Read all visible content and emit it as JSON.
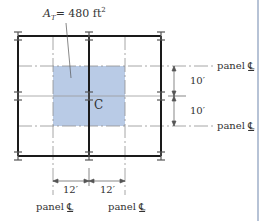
{
  "figure": {
    "tributary_area_label": {
      "symbol": "A",
      "subscript": "T",
      "equals": "= 480 ft",
      "superscript": "2"
    },
    "column_label": "C",
    "dimensions": {
      "vertical": [
        "10′",
        "10′"
      ],
      "horizontal": [
        "12′",
        "12′"
      ]
    },
    "panel_centerlines": {
      "right": [
        {
          "text": "panel",
          "symbol": "℄"
        },
        {
          "text": "panel",
          "symbol": "℄"
        }
      ],
      "bottom": [
        {
          "text": "panel",
          "symbol": "℄"
        },
        {
          "text": "panel",
          "symbol": "℄"
        }
      ]
    },
    "colors": {
      "shaded_area": "#b9cbe6",
      "beam": "#1a1a1a",
      "centerline": "#8a8a8a",
      "column": "#555555"
    },
    "grid": {
      "columns_x": [
        18,
        89,
        161
      ],
      "rows_y": [
        36,
        96,
        156
      ],
      "shaded": {
        "x": 53,
        "y": 66,
        "w": 72,
        "h": 60
      }
    }
  }
}
